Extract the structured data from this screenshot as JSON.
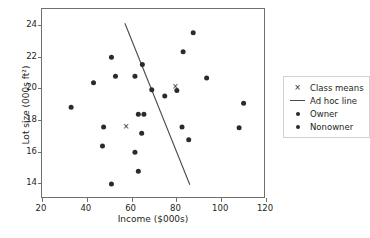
{
  "chart_data": {
    "type": "scatter",
    "title": "",
    "xlabel": "Income ($000s)",
    "ylabel": "Lot size (000s ft²)",
    "xlim": [
      20,
      120
    ],
    "ylim": [
      13.0,
      25.0
    ],
    "xticks": [
      20,
      40,
      60,
      80,
      100,
      120
    ],
    "yticks": [
      14,
      16,
      18,
      20,
      22,
      24
    ],
    "grid": false,
    "legend_position": "right-outside",
    "series": [
      {
        "name": "Owner",
        "marker": "circle",
        "color": "#2b2b2b",
        "points": [
          [
            51.0,
            21.95
          ],
          [
            52.8,
            20.75
          ],
          [
            61.5,
            20.75
          ],
          [
            64.8,
            21.5
          ],
          [
            69.0,
            19.9
          ],
          [
            74.8,
            19.5
          ],
          [
            80.2,
            19.85
          ],
          [
            83.0,
            22.3
          ],
          [
            87.5,
            23.5
          ],
          [
            93.5,
            20.65
          ],
          [
            110.0,
            19.05
          ],
          [
            63.0,
            18.35
          ]
        ]
      },
      {
        "name": "Nonowner",
        "marker": "circle",
        "color": "#2b2b2b",
        "points": [
          [
            33.0,
            18.8
          ],
          [
            43.0,
            20.35
          ],
          [
            47.5,
            17.55
          ],
          [
            47.0,
            16.35
          ],
          [
            51.0,
            13.95
          ],
          [
            61.5,
            15.95
          ],
          [
            63.0,
            14.75
          ],
          [
            64.5,
            17.15
          ],
          [
            65.5,
            18.35
          ],
          [
            82.5,
            17.55
          ],
          [
            85.5,
            16.75
          ],
          [
            108.0,
            17.5
          ]
        ]
      },
      {
        "name": "Class means",
        "marker": "x",
        "color": "#231f20",
        "points": [
          [
            57.5,
            17.6
          ],
          [
            79.5,
            20.15
          ]
        ]
      }
    ],
    "lines": [
      {
        "name": "Ad hoc line",
        "color": "#4a4a4a",
        "x": [
          57.0,
          86.0
        ],
        "y": [
          24.1,
          13.9
        ]
      }
    ],
    "legend": [
      {
        "label": "Class means",
        "key": "x-marker-icon",
        "color": "#231f20"
      },
      {
        "label": "Ad hoc line",
        "key": "line-segment-icon",
        "color": "#4a4a4a"
      },
      {
        "label": "Owner",
        "key": "dot-marker-icon",
        "color": "#2b2b2b"
      },
      {
        "label": "Nonowner",
        "key": "dot-marker-icon",
        "color": "#2b2b2b"
      }
    ]
  }
}
